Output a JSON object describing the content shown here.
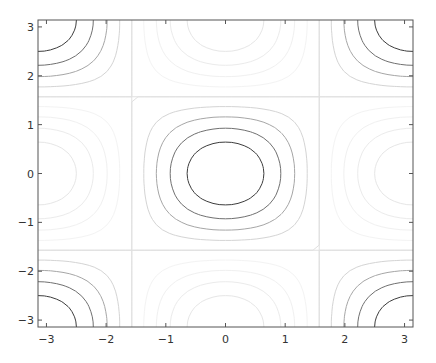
{
  "chart_data": {
    "type": "contour",
    "title": "",
    "xlabel": "",
    "ylabel": "",
    "function": "cos(x) * cos(y)",
    "xlim": [
      -3.1416,
      3.1416
    ],
    "ylim": [
      -3.1416,
      3.1416
    ],
    "x_ticks": [
      -3,
      -2,
      -1,
      0,
      1,
      2,
      3
    ],
    "y_ticks": [
      -3,
      -2,
      -1,
      0,
      1,
      2,
      3
    ],
    "x_tick_labels": [
      "-3",
      "-2",
      "-1",
      "0",
      "1",
      "2",
      "3"
    ],
    "y_tick_labels": [
      "-3",
      "-2",
      "-1",
      "0",
      "1",
      "2",
      "3"
    ],
    "levels": [
      -0.8,
      -0.6,
      -0.4,
      -0.2,
      0.0,
      0.2,
      0.4,
      0.6,
      0.8
    ],
    "level_colors": {
      "-0.8": "#e6e6e6",
      "-0.6": "#ebebeb",
      "-0.4": "#f0f0f0",
      "-0.2": "#f3f3f3",
      "0.0": "#e0e0e0",
      "0.2": "#d4d4d4",
      "0.4": "#a6a6a6",
      "0.6": "#707070",
      "0.8": "#3c3c3c"
    },
    "grid": false,
    "legend": null
  },
  "plot_area": {
    "left": 38,
    "top": 20,
    "right": 413,
    "bottom": 327
  },
  "colors": {
    "axis": "#555555",
    "background": "#ffffff"
  }
}
